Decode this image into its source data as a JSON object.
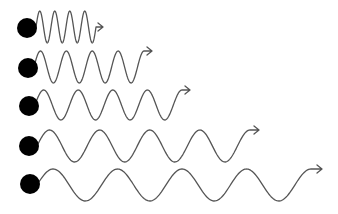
{
  "diagram": {
    "colors": {
      "background": "#ffffff",
      "source": "#000000",
      "wave": "#555555"
    },
    "waves": [
      {
        "id": 1,
        "source": {
          "cx": 27,
          "cy": 28,
          "r": 10
        },
        "x_start": 36,
        "x_end": 96,
        "y_mid": 27,
        "amplitude": 16,
        "cycles": 4,
        "arrow_len": 7
      },
      {
        "id": 2,
        "source": {
          "cx": 28,
          "cy": 68,
          "r": 10
        },
        "x_start": 34,
        "x_end": 144,
        "y_mid": 67,
        "amplitude": 16,
        "cycles": 4.25,
        "arrow_len": 8
      },
      {
        "id": 3,
        "source": {
          "cx": 29,
          "cy": 106,
          "r": 10
        },
        "x_start": 35,
        "x_end": 182,
        "y_mid": 105,
        "amplitude": 15,
        "cycles": 4.25,
        "arrow_len": 8
      },
      {
        "id": 4,
        "source": {
          "cx": 29,
          "cy": 146,
          "r": 10
        },
        "x_start": 37,
        "x_end": 250,
        "y_mid": 146,
        "amplitude": 16,
        "cycles": 4.25,
        "arrow_len": 9
      },
      {
        "id": 5,
        "source": {
          "cx": 30,
          "cy": 184,
          "r": 10
        },
        "x_start": 37,
        "x_end": 311,
        "y_mid": 185,
        "amplitude": 16,
        "cycles": 4.25,
        "arrow_len": 11
      }
    ]
  }
}
